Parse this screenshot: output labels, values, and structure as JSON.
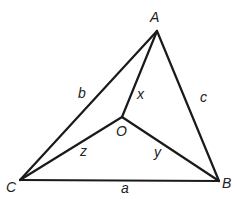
{
  "diagram": {
    "type": "geometry",
    "stroke_color": "#1a1a1a",
    "vertices": {
      "A": {
        "label": "A",
        "x": 157,
        "y": 31,
        "label_x": 150,
        "label_y": 22
      },
      "B": {
        "label": "B",
        "x": 219,
        "y": 181,
        "label_x": 222,
        "label_y": 188
      },
      "C": {
        "label": "C",
        "x": 20,
        "y": 180,
        "label_x": 6,
        "label_y": 192
      },
      "O": {
        "label": "O",
        "x": 122,
        "y": 117,
        "label_x": 116,
        "label_y": 136
      }
    },
    "edges": [
      {
        "from": "C",
        "to": "B",
        "label": "a",
        "label_x": 121,
        "label_y": 193
      },
      {
        "from": "C",
        "to": "A",
        "label": "b",
        "label_x": 78,
        "label_y": 98
      },
      {
        "from": "A",
        "to": "B",
        "label": "c",
        "label_x": 200,
        "label_y": 102
      },
      {
        "from": "O",
        "to": "A",
        "label": "x",
        "label_x": 137,
        "label_y": 99
      },
      {
        "from": "O",
        "to": "B",
        "label": "y",
        "label_x": 154,
        "label_y": 157
      },
      {
        "from": "O",
        "to": "C",
        "label": "z",
        "label_x": 80,
        "label_y": 156
      }
    ]
  }
}
